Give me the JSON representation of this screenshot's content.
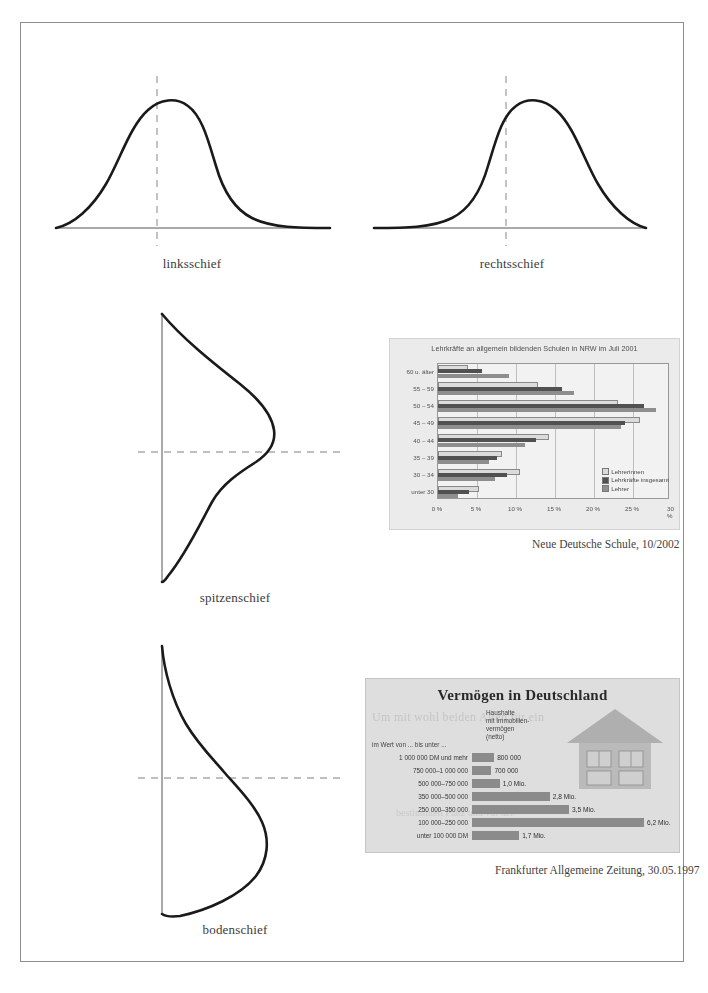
{
  "figure": {
    "curves": [
      {
        "id": "linksschief",
        "label": "linksschief",
        "orientation": "horizontal",
        "skew": "right-tail"
      },
      {
        "id": "rechtsschief",
        "label": "rechtsschief",
        "orientation": "horizontal",
        "skew": "left-tail"
      },
      {
        "id": "spitzenschief",
        "label": "spitzenschief",
        "orientation": "vertical",
        "skew": "peak-low"
      },
      {
        "id": "bodenschief",
        "label": "bodenschief",
        "orientation": "vertical",
        "skew": "peak-high"
      }
    ]
  },
  "chart_data": [
    {
      "type": "bar",
      "orientation": "horizontal",
      "title": "Lehrkräfte an allgemein bildenden Schulen in NRW im Juli 2001",
      "source": "Neue Deutsche Schule, 10/2002",
      "credit": "Grafik\nLDS NRW",
      "xlabel": "",
      "ylabel": "",
      "xlim": [
        0,
        30
      ],
      "xunit": "%",
      "grid": true,
      "legend_position": "bottom-right",
      "xticks": [
        "0 %",
        "5 %",
        "10 %",
        "15 %",
        "20 %",
        "25 %",
        "30 %"
      ],
      "categories": [
        "60 u. älter",
        "55 – 59",
        "50 – 54",
        "45 – 49",
        "40 – 44",
        "35 – 39",
        "30 – 34",
        "unter 30"
      ],
      "series": [
        {
          "name": "Lehrerinnen",
          "color": "#e2e2e0",
          "values": [
            3.6,
            12.6,
            22.8,
            25.6,
            14.0,
            8.0,
            10.3,
            5.0
          ]
        },
        {
          "name": "Lehrkräfte insgesamt",
          "color": "#4d4d4d",
          "values": [
            5.6,
            15.9,
            26.4,
            24.0,
            12.6,
            7.6,
            8.9,
            4.0
          ]
        },
        {
          "name": "Lehrer",
          "color": "#8f8f8f",
          "values": [
            9.1,
            17.4,
            27.9,
            23.4,
            11.2,
            6.6,
            7.3,
            2.6
          ]
        }
      ]
    },
    {
      "type": "bar",
      "orientation": "horizontal",
      "title": "Vermögen in Deutschland",
      "subtitle": "Haushalte\nmit Immobilien-\nvermögen\n(netto)",
      "scale_note": "im Wert von ... bis unter ...",
      "source": "Frankfurter Allgemeine Zeitung, 30.05.1997",
      "ghost_text_1": "Um mit wohl beiden Alten für ein",
      "ghost_text_2": "bestimmten Platz und vor der",
      "categories": [
        "1 000 000 DM und mehr",
        "750 000–1 000 000",
        "500 000–750 000",
        "350 000–500 000",
        "250 000–350 000",
        "100 000–250 000",
        "unter 100 000 DM"
      ],
      "values": [
        0.8,
        0.7,
        1.0,
        2.8,
        3.5,
        6.2,
        1.7
      ],
      "value_labels": [
        "800 000",
        "700 000",
        "1,0 Mio.",
        "2,8 Mio.",
        "3,5 Mio.",
        "6,2 Mio.",
        "1,7 Mio."
      ],
      "unit": "Haushalte",
      "bar_color": "#8c8c8c"
    }
  ],
  "bottom_note": ""
}
